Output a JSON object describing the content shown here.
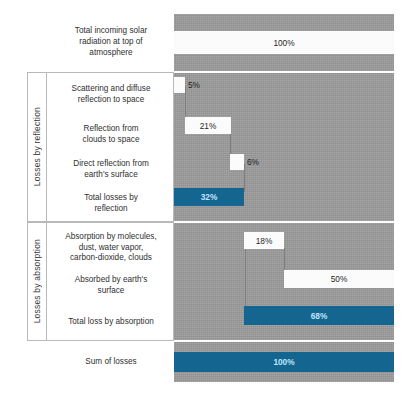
{
  "chart_data": {
    "type": "bar",
    "subtype": "waterfall",
    "title": "",
    "xlabel": "",
    "ylabel": "",
    "xlim": [
      0,
      100
    ],
    "unit": "%",
    "grid": false,
    "legend": "none",
    "colors": {
      "plot_background": "#9b9b9b",
      "bar_white": "#fbfbfb",
      "bar_blue": "#14658f",
      "blue_label_text": "#bfe6fb",
      "border": "#b9b9b9"
    },
    "categories": [
      "Total incoming solar radiation at top of atmosphere",
      "Scattering and diffuse reflection to space",
      "Reflection from clouds to space",
      "Direct reflection from earth's surface",
      "Total losses by reflection",
      "Absorption by molecules, dust, water vapor, carbon-dioxide, clouds",
      "Absorbed by earth's surface",
      "Total loss by absorption",
      "Sum of losses"
    ],
    "values": [
      100,
      5,
      21,
      6,
      32,
      18,
      50,
      68,
      100
    ],
    "starts": [
      0,
      0,
      5,
      26,
      0,
      32,
      50,
      32,
      0
    ],
    "ends": [
      100,
      5,
      26,
      32,
      32,
      50,
      100,
      100,
      100
    ],
    "kinds": [
      "total",
      "step",
      "step",
      "step",
      "subtotal",
      "step",
      "step",
      "subtotal",
      "total"
    ]
  },
  "groups": [
    {
      "id": "reflection",
      "label": "Losses by reflection"
    },
    {
      "id": "absorption",
      "label": "Losses by absorption"
    }
  ],
  "rows": [
    {
      "id": "incoming",
      "label": "Total incoming solar\nradiation at top of\natmosphere",
      "value_label": "100%"
    },
    {
      "id": "scattering",
      "label": "Scattering and diffuse\nreflection to space",
      "value_label": "5%"
    },
    {
      "id": "clouds",
      "label": "Reflection from\nclouds to space",
      "value_label": "21%"
    },
    {
      "id": "direct",
      "label": "Direct reflection from\nearth's surface",
      "value_label": "6%"
    },
    {
      "id": "total-reflect",
      "label": "Total losses by\nreflection",
      "value_label": "32%"
    },
    {
      "id": "absorb-mol",
      "label": "Absorption by molecules,\ndust, water vapor,\ncarbon-dioxide, clouds",
      "value_label": "18%"
    },
    {
      "id": "absorb-surface",
      "label": "Absorbed by earth's\nsurface",
      "value_label": "50%"
    },
    {
      "id": "total-absorb",
      "label": "Total loss by absorption",
      "value_label": "68%"
    },
    {
      "id": "sum",
      "label": "Sum of losses",
      "value_label": "100%"
    }
  ]
}
